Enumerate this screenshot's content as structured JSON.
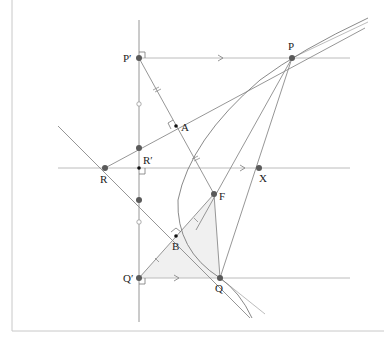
{
  "figure": {
    "caption_fragment": "",
    "points": {
      "P_prime": {
        "label": "P′",
        "x": 139,
        "y": 58
      },
      "P": {
        "label": "P",
        "x": 292,
        "y": 58
      },
      "A": {
        "label": "A",
        "x": 176,
        "y": 126
      },
      "R": {
        "label": "R",
        "x": 105,
        "y": 168
      },
      "R_prime": {
        "label": "R′",
        "x": 139,
        "y": 168
      },
      "X": {
        "label": "X",
        "x": 259,
        "y": 168
      },
      "F": {
        "label": "F",
        "x": 214,
        "y": 194
      },
      "B": {
        "label": "B",
        "x": 176,
        "y": 236
      },
      "Q_prime": {
        "label": "Q′",
        "x": 139,
        "y": 278
      },
      "Q": {
        "label": "Q",
        "x": 220,
        "y": 278
      }
    },
    "colors": {
      "line": "#8a8a8a",
      "point": "#5a5a5a",
      "shade": "#f0f0f0",
      "frame": "#c8c8c8"
    }
  }
}
